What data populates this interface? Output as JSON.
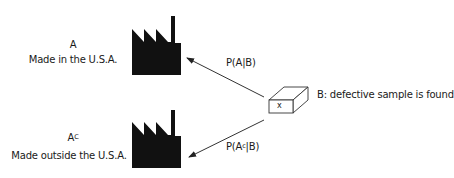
{
  "diagram": {
    "event_a": {
      "symbol": "A",
      "label": "Made in the U.S.A."
    },
    "event_a_complement": {
      "symbol": "A",
      "superscript": "C",
      "label": "Made outside the U.S.A."
    },
    "event_b": {
      "box_mark": "x",
      "label": "B: defective sample is found"
    },
    "arrows": [
      {
        "from": "defective-sample",
        "to": "factory-usa",
        "label_prefix": "P(A",
        "label_sup": "",
        "label_suffix": "|B)"
      },
      {
        "from": "defective-sample",
        "to": "factory-outside-usa",
        "label_prefix": "P(A",
        "label_sup": "c",
        "label_suffix": "|B)"
      }
    ],
    "icons": {
      "factory": "factory-icon",
      "box": "box-icon"
    },
    "colors": {
      "ink": "#111111",
      "arrow": "#333333",
      "background": "#ffffff"
    }
  }
}
